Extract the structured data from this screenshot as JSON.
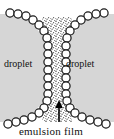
{
  "figure": {
    "type": "schematic-diagram",
    "width": 114,
    "height": 139,
    "background_color": "#ffffff"
  },
  "labels": {
    "droplet_left": "droplet",
    "droplet_right": "droplet",
    "emulsion_film": "emulsion film"
  },
  "colors": {
    "droplet_fill": "#d6d6d6",
    "outline": "#1a1a1a",
    "surfactant_fill": "#ffffff",
    "film_stipple": "#4d4d4d",
    "text": "#111111",
    "arrow": "#000000"
  },
  "elements": {
    "droplet_left_name": "left droplet",
    "droplet_right_name": "right droplet",
    "film_name": "emulsion film channel",
    "surfactant_name": "surfactant molecule circles",
    "arrow_name": "pointer arrow to emulsion film"
  },
  "geometry": {
    "film_center_x": 57,
    "film_top_half_width": 13,
    "film_waist_half_width": 7,
    "circle_radius": 4.1,
    "arrow_x": 59,
    "arrow_tip_y": 101,
    "arrow_tail_y": 122
  }
}
